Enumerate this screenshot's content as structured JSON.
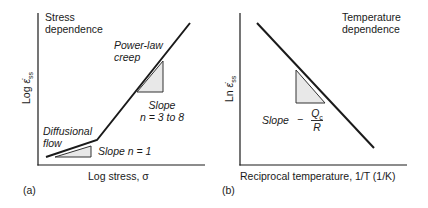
{
  "panel_a": {
    "tag": "(a)",
    "title_line1": "Stress",
    "title_line2": "dependence",
    "ylabel": "Log ε̇ss",
    "ylabel_main": "Log ",
    "ylabel_sym": "ε̇",
    "ylabel_sub": "ss",
    "xlabel": "Log stress, σ",
    "regime_upper_line1": "Power-law",
    "regime_upper_line2": "creep",
    "regime_lower_line1": "Diffusional",
    "regime_lower_line2": "flow",
    "slope_upper_line1": "Slope",
    "slope_upper_line2": "n = 3 to 8",
    "slope_lower": "Slope n = 1"
  },
  "panel_b": {
    "tag": "(b)",
    "title_line1": "Temperature",
    "title_line2": "dependence",
    "ylabel_main": "Ln ",
    "ylabel_sym": "ε̇",
    "ylabel_sub": "ss",
    "xlabel": "Reciprocal temperature, 1/T (1/K)",
    "slope_label": "Slope",
    "slope_minus": "−",
    "slope_numerator": "Qc",
    "slope_denominator": "R"
  },
  "colors": {
    "line": "#1a1a1a",
    "triangle_fill": "#e8e8e8",
    "triangle_stroke": "#333333"
  }
}
